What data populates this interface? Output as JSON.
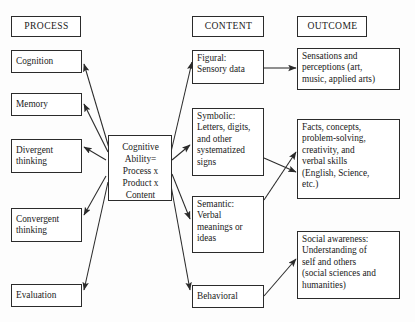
{
  "diagram": {
    "title_implied": "Structure of Intellect model",
    "headers": {
      "process": "PROCESS",
      "content": "CONTENT",
      "outcome": "OUTCOME"
    },
    "process_boxes": [
      {
        "label": "Cognition"
      },
      {
        "label": "Memory"
      },
      {
        "label": "Divergent\nthinking"
      },
      {
        "label": "Convergent\nthinking"
      },
      {
        "label": "Evaluation"
      }
    ],
    "center_box": {
      "label": "Cognitive\nAbility=\nProcess x\nProduct x\nContent"
    },
    "content_boxes": [
      {
        "label": "Figural:\nSensory data"
      },
      {
        "label": "Symbolic:\nLetters, digits,\nand other\nsystematized\nsigns"
      },
      {
        "label": "Semantic:\nVerbal\nmeanings or\nideas"
      },
      {
        "label": "Behavioral"
      }
    ],
    "outcome_boxes": [
      {
        "label": "Sensations and\nperceptions (art,\nmusic, applied arts)"
      },
      {
        "label": "Facts, concepts,\nproblem-solving,\ncreativity, and\nverbal skills\n(English, Science,\netc.)"
      },
      {
        "label": "Social awareness:\nUnderstanding of\nself and others\n(social sciences and\nhumanities)"
      }
    ],
    "colors": {
      "line": "#2b2b2b",
      "text": "#1a1a1a",
      "background": "#fdfdfd"
    }
  }
}
